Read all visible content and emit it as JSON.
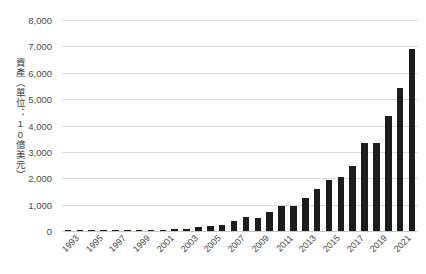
{
  "chart_data": {
    "type": "bar",
    "title": "",
    "subtitle": "",
    "xlabel": "",
    "ylabel": "資產（單位：10億美元）",
    "ylim": [
      0,
      8000
    ],
    "ytick_values": [
      0,
      1000,
      2000,
      3000,
      4000,
      5000,
      6000,
      7000,
      8000
    ],
    "ytick_labels": [
      "0",
      "1,000",
      "2,000",
      "3,000",
      "4,000",
      "5,000",
      "6,000",
      "7,000",
      "8,000"
    ],
    "grid": true,
    "legend": null,
    "bar_color": "#1c1c1c",
    "gridline_color": "#d9d9d9",
    "categories": [
      "1993",
      "1994",
      "1995",
      "1996",
      "1997",
      "1998",
      "1999",
      "2000",
      "2001",
      "2002",
      "2003",
      "2004",
      "2005",
      "2006",
      "2007",
      "2008",
      "2009",
      "2010",
      "2011",
      "2012",
      "2013",
      "2014",
      "2015",
      "2016",
      "2017",
      "2018",
      "2019",
      "2020",
      "2021",
      "2022"
    ],
    "xtick_labels": [
      "1993",
      "1995",
      "1997",
      "1999",
      "2001",
      "2003",
      "2005",
      "2007",
      "2009",
      "2011",
      "2013",
      "2015",
      "2017",
      "2019",
      "2021"
    ],
    "values": [
      5,
      8,
      12,
      18,
      25,
      32,
      40,
      48,
      55,
      70,
      95,
      135,
      175,
      230,
      385,
      530,
      490,
      730,
      930,
      965,
      1270,
      1610,
      1925,
      2060,
      2450,
      3350,
      3330,
      4350,
      5430,
      6900
    ]
  }
}
